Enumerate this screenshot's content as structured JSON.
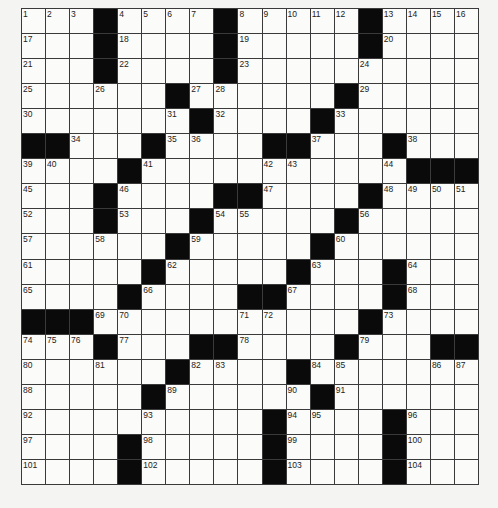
{
  "puzzle": {
    "rows": 19,
    "cols": 19,
    "colors": {
      "black": "#0a0a0a",
      "white": "#fbfbf9",
      "line": "#3a3a3a",
      "page": "#f4f4f2"
    },
    "grid": [
      [
        1,
        2,
        3,
        "#",
        4,
        5,
        6,
        7,
        "#",
        8,
        9,
        10,
        11,
        12,
        "#",
        13,
        14,
        15,
        16
      ],
      [
        17,
        "",
        "",
        "#",
        18,
        "",
        "",
        "",
        "#",
        19,
        "",
        "",
        "",
        "",
        "#",
        20,
        "",
        "",
        ""
      ],
      [
        21,
        "",
        "",
        "#",
        22,
        "",
        "",
        "",
        "#",
        23,
        "",
        "",
        "",
        "",
        24,
        "",
        "",
        "",
        ""
      ],
      [
        25,
        "",
        "",
        26,
        "",
        "",
        "#",
        27,
        28,
        "",
        "",
        "",
        "",
        "#",
        29,
        "",
        "",
        "",
        ""
      ],
      [
        30,
        "",
        "",
        "",
        "",
        "",
        31,
        "#",
        32,
        "",
        "",
        "",
        "#",
        33,
        "",
        "",
        "",
        "",
        ""
      ],
      [
        "#",
        "#",
        34,
        "",
        "",
        "#",
        35,
        36,
        "",
        "",
        "#",
        "#",
        37,
        "",
        "",
        "#",
        38,
        "",
        ""
      ],
      [
        39,
        40,
        "",
        "",
        "#",
        41,
        "",
        "",
        "",
        "",
        42,
        43,
        "",
        "",
        "",
        44,
        "#",
        "#",
        "#"
      ],
      [
        45,
        "",
        "",
        "#",
        46,
        "",
        "",
        "",
        "#",
        "#",
        47,
        "",
        "",
        "",
        "#",
        48,
        49,
        50,
        51
      ],
      [
        52,
        "",
        "",
        "#",
        53,
        "",
        "",
        "#",
        54,
        55,
        "",
        "",
        "",
        "#",
        56,
        "",
        "",
        "",
        ""
      ],
      [
        57,
        "",
        "",
        58,
        "",
        "",
        "#",
        59,
        "",
        "",
        "",
        "",
        "#",
        60,
        "",
        "",
        "",
        "",
        ""
      ],
      [
        61,
        "",
        "",
        "",
        "",
        "#",
        62,
        "",
        "",
        "",
        "",
        "#",
        63,
        "",
        "",
        "#",
        64,
        "",
        ""
      ],
      [
        65,
        "",
        "",
        "",
        "#",
        66,
        "",
        "",
        "",
        "#",
        "#",
        67,
        "",
        "",
        "",
        "#",
        68,
        "",
        ""
      ],
      [
        "#",
        "#",
        "#",
        69,
        70,
        "",
        "",
        "",
        "",
        71,
        72,
        "",
        "",
        "",
        "#",
        73,
        "",
        "",
        ""
      ],
      [
        74,
        75,
        76,
        "#",
        77,
        "",
        "",
        "#",
        "#",
        78,
        "",
        "",
        "",
        "#",
        79,
        "",
        "",
        "#",
        "#"
      ],
      [
        80,
        "",
        "",
        81,
        "",
        "",
        "#",
        82,
        83,
        "",
        "",
        "#",
        84,
        85,
        "",
        "",
        "",
        86,
        87
      ],
      [
        88,
        "",
        "",
        "",
        "",
        "#",
        89,
        "",
        "",
        "",
        "",
        90,
        "#",
        91,
        "",
        "",
        "",
        "",
        ""
      ],
      [
        92,
        "",
        "",
        "",
        "",
        93,
        "",
        "",
        "",
        "",
        "#",
        94,
        95,
        "",
        "",
        "#",
        96,
        "",
        ""
      ],
      [
        97,
        "",
        "",
        "",
        "#",
        98,
        "",
        "",
        "",
        "",
        "#",
        99,
        "",
        "",
        "",
        "#",
        100,
        "",
        ""
      ],
      [
        101,
        "",
        "",
        "",
        "#",
        102,
        "",
        "",
        "",
        "",
        "#",
        103,
        "",
        "",
        "",
        "#",
        104,
        "",
        ""
      ]
    ]
  }
}
